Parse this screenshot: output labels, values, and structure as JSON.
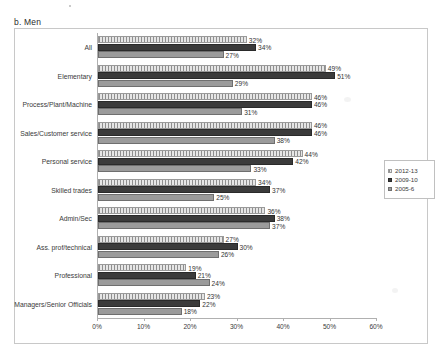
{
  "figure": {
    "title": "b. Men"
  },
  "legend": {
    "position": "right-middle",
    "items": [
      {
        "label": "2012-13",
        "swatch": "hatched-light"
      },
      {
        "label": "2009-10",
        "swatch": "solid-dark"
      },
      {
        "label": "2005-6",
        "swatch": "solid-gray"
      }
    ]
  },
  "chart_data": {
    "type": "bar",
    "orientation": "horizontal",
    "title": "b. Men",
    "xlabel": "",
    "ylabel": "",
    "xlim": [
      0,
      60
    ],
    "xticks": [
      "0%",
      "10%",
      "20%",
      "30%",
      "40%",
      "50%",
      "60%"
    ],
    "xtick_values": [
      0,
      10,
      20,
      30,
      40,
      50,
      60
    ],
    "grid": false,
    "legend_position": "right",
    "categories": [
      "All",
      "Elementary",
      "Process/Plant/Machine",
      "Sales/Customer service",
      "Personal service",
      "Skilled trades",
      "Admin/Sec",
      "Ass. prof/technical",
      "Professional",
      "Managers/Senior Officials"
    ],
    "series": [
      {
        "name": "2012-13",
        "values": [
          32,
          49,
          46,
          46,
          44,
          34,
          36,
          27,
          19,
          23
        ],
        "labels": [
          "32%",
          "49%",
          "46%",
          "46%",
          "44%",
          "34%",
          "36%",
          "27%",
          "19%",
          "23%"
        ]
      },
      {
        "name": "2009-10",
        "values": [
          34,
          51,
          46,
          46,
          42,
          37,
          38,
          30,
          21,
          22
        ],
        "labels": [
          "34%",
          "51%",
          "46%",
          "46%",
          "42%",
          "37%",
          "38%",
          "30%",
          "21%",
          "22%"
        ]
      },
      {
        "name": "2005-6",
        "values": [
          27,
          29,
          31,
          38,
          33,
          25,
          37,
          26,
          24,
          18
        ],
        "labels": [
          "27%",
          "29%",
          "31%",
          "38%",
          "33%",
          "25%",
          "37%",
          "26%",
          "24%",
          "18%"
        ]
      }
    ]
  }
}
